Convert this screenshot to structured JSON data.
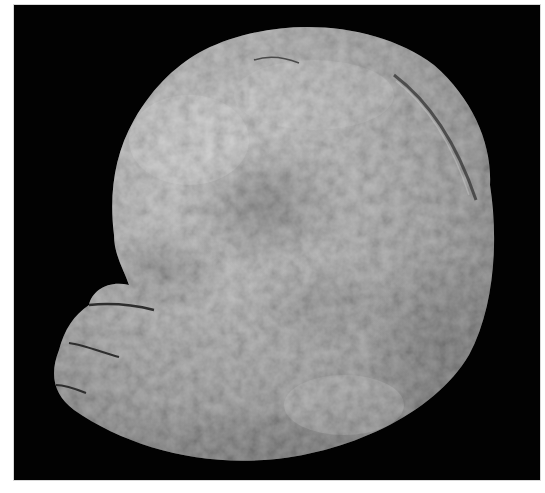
{
  "image": {
    "subject": "grayscale photograph of a rounded, lobed organic specimen on black background",
    "background_color": "#020202",
    "border_color": "#ffffff",
    "specimen_tone_light": "#b9b9b9",
    "specimen_tone_mid": "#8e8e8e",
    "specimen_tone_dark": "#5a5a5a"
  }
}
